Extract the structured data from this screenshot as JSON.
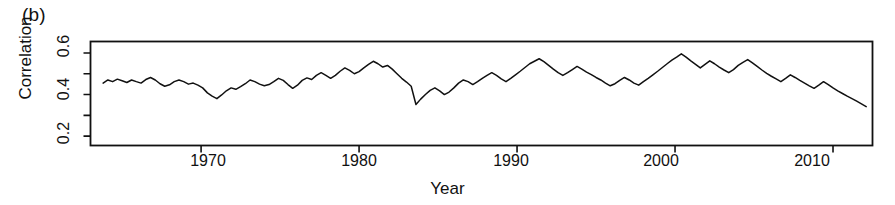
{
  "figure": {
    "panel_label": "(b)",
    "background": "#ffffff",
    "line_color": "#111111",
    "axis_color": "#111111"
  },
  "chart_data": {
    "type": "line",
    "title": "",
    "panel": "(b)",
    "xlabel": "Year",
    "ylabel": "Correlation",
    "xlim": [
      1963.0,
      1912.0
    ],
    "x_range": [
      1963.0,
      2012.5
    ],
    "ylim": [
      0.155,
      0.655
    ],
    "grid": false,
    "legend": null,
    "x_ticks": [
      1970,
      1980,
      1990,
      2000,
      2010
    ],
    "x_tick_labels": [
      "1970",
      "1980",
      "1990",
      "2000",
      "2010"
    ],
    "y_ticks": [
      0.2,
      0.3,
      0.4,
      0.5,
      0.6
    ],
    "y_tick_labels": [
      "0.2",
      "",
      "0.4",
      "",
      "0.6"
    ],
    "y_minor_ticks": [
      0.3,
      0.5
    ],
    "series": [
      {
        "name": "correlation",
        "x": [
          1963.8,
          1964.1,
          1964.4,
          1964.7,
          1965.0,
          1965.3,
          1965.6,
          1965.9,
          1966.2,
          1966.5,
          1966.8,
          1967.1,
          1967.4,
          1967.7,
          1968.0,
          1968.3,
          1968.6,
          1968.9,
          1969.2,
          1969.5,
          1969.8,
          1970.1,
          1970.4,
          1970.7,
          1971.0,
          1971.3,
          1971.6,
          1971.9,
          1972.2,
          1972.5,
          1972.8,
          1973.1,
          1973.4,
          1973.7,
          1974.0,
          1974.3,
          1974.6,
          1974.9,
          1975.2,
          1975.5,
          1975.8,
          1976.1,
          1976.4,
          1976.7,
          1977.0,
          1977.3,
          1977.6,
          1977.9,
          1978.2,
          1978.5,
          1978.8,
          1979.1,
          1979.4,
          1979.7,
          1980.0,
          1980.3,
          1980.6,
          1980.9,
          1981.2,
          1981.5,
          1981.8,
          1982.1,
          1982.4,
          1982.7,
          1983.0,
          1983.3,
          1983.6,
          1983.9,
          1984.2,
          1984.5,
          1984.8,
          1985.1,
          1985.4,
          1985.7,
          1986.0,
          1986.3,
          1986.6,
          1986.9,
          1987.2,
          1987.5,
          1987.8,
          1988.1,
          1988.4,
          1988.7,
          1989.0,
          1989.3,
          1989.6,
          1989.9,
          1990.2,
          1990.5,
          1990.8,
          1991.1,
          1991.4,
          1991.7,
          1992.0,
          1992.3,
          1992.6,
          1992.9,
          1993.2,
          1993.5,
          1993.8,
          1994.1,
          1994.4,
          1994.7,
          1995.0,
          1995.3,
          1995.6,
          1995.9,
          1996.2,
          1996.5,
          1996.8,
          1997.1,
          1997.4,
          1997.7,
          1998.0,
          1998.3,
          1998.6,
          1998.9,
          1999.2,
          1999.5,
          1999.8,
          2000.1,
          2000.4,
          2000.7,
          2001.0,
          2001.3,
          2001.6,
          2001.9,
          2002.2,
          2002.5,
          2002.8,
          2003.1,
          2003.4,
          2003.7,
          2004.0,
          2004.3,
          2004.6,
          2004.9,
          2005.2,
          2005.5,
          2005.8,
          2006.1,
          2006.4,
          2006.7,
          2007.0,
          2007.3,
          2007.6,
          2007.9,
          2008.2,
          2008.5,
          2008.8,
          2009.1,
          2009.4,
          2009.7,
          2010.0,
          2010.3,
          2010.6,
          2010.9,
          2011.2,
          2011.5,
          2011.8,
          2012.1
        ],
        "y": [
          0.455,
          0.47,
          0.462,
          0.474,
          0.466,
          0.458,
          0.47,
          0.462,
          0.455,
          0.472,
          0.482,
          0.47,
          0.452,
          0.44,
          0.447,
          0.462,
          0.47,
          0.462,
          0.45,
          0.455,
          0.445,
          0.432,
          0.408,
          0.392,
          0.38,
          0.398,
          0.418,
          0.432,
          0.425,
          0.438,
          0.452,
          0.47,
          0.462,
          0.45,
          0.442,
          0.448,
          0.462,
          0.478,
          0.468,
          0.448,
          0.43,
          0.445,
          0.468,
          0.48,
          0.472,
          0.492,
          0.505,
          0.492,
          0.478,
          0.492,
          0.512,
          0.528,
          0.516,
          0.5,
          0.51,
          0.528,
          0.545,
          0.56,
          0.548,
          0.532,
          0.54,
          0.522,
          0.5,
          0.478,
          0.46,
          0.44,
          0.352,
          0.378,
          0.4,
          0.42,
          0.432,
          0.418,
          0.4,
          0.412,
          0.432,
          0.455,
          0.47,
          0.462,
          0.448,
          0.462,
          0.478,
          0.492,
          0.505,
          0.492,
          0.475,
          0.462,
          0.478,
          0.495,
          0.512,
          0.53,
          0.548,
          0.56,
          0.572,
          0.558,
          0.54,
          0.522,
          0.505,
          0.492,
          0.505,
          0.52,
          0.535,
          0.522,
          0.508,
          0.496,
          0.482,
          0.47,
          0.455,
          0.442,
          0.452,
          0.468,
          0.482,
          0.47,
          0.455,
          0.445,
          0.462,
          0.478,
          0.495,
          0.512,
          0.53,
          0.548,
          0.565,
          0.58,
          0.596,
          0.58,
          0.562,
          0.545,
          0.528,
          0.545,
          0.562,
          0.548,
          0.532,
          0.518,
          0.505,
          0.52,
          0.54,
          0.555,
          0.568,
          0.552,
          0.535,
          0.518,
          0.502,
          0.488,
          0.475,
          0.462,
          0.478,
          0.495,
          0.482,
          0.468,
          0.455,
          0.442,
          0.43,
          0.445,
          0.462,
          0.448,
          0.432,
          0.418,
          0.405,
          0.392,
          0.38,
          0.368,
          0.355,
          0.342
        ]
      }
    ]
  }
}
